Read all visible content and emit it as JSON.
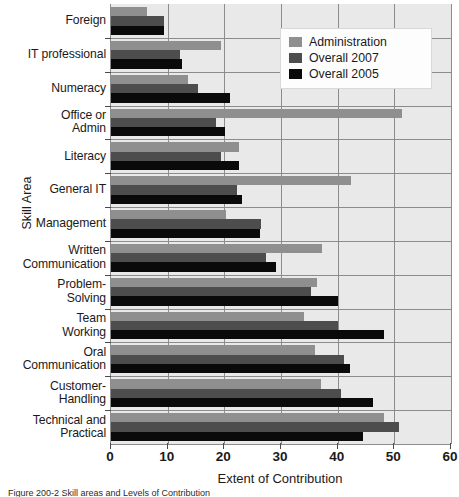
{
  "chart_data": {
    "type": "bar",
    "orientation": "horizontal",
    "title": "",
    "xlabel": "Extent of Contribution",
    "ylabel": "Skill Area",
    "xlim": [
      0,
      60
    ],
    "xticks": [
      0,
      10,
      20,
      30,
      40,
      50,
      60
    ],
    "grid": true,
    "legend_position": "top-right",
    "categories": [
      "Foreign",
      "IT professional",
      "Numeracy",
      "Office or\nAdmin",
      "Literacy",
      "General IT",
      "Management",
      "Written\nCommunication",
      "Problem-\nSolving",
      "Team\nWorking",
      "Oral\nCommunication",
      "Customer-\nHandling",
      "Technical and\nPractical"
    ],
    "series": [
      {
        "name": "Administration",
        "color": "#8f8f8f",
        "values": [
          6.3,
          19.4,
          13.6,
          51.3,
          22.6,
          42.3,
          20.3,
          37.3,
          36.3,
          34.0,
          36.0,
          37.0,
          48.1
        ]
      },
      {
        "name": "Overall 2007",
        "color": "#4d4d4d",
        "values": [
          9.3,
          12.2,
          15.3,
          18.5,
          19.4,
          22.3,
          26.5,
          27.3,
          35.3,
          40.0,
          41.2,
          40.6,
          50.9
        ]
      },
      {
        "name": "Overall 2005",
        "color": "#0a0a0a",
        "values": [
          9.4,
          12.5,
          21.0,
          20.1,
          22.6,
          23.2,
          26.3,
          29.1,
          40.0,
          48.2,
          42.2,
          46.2,
          44.4
        ]
      }
    ]
  },
  "legend": {
    "items": [
      {
        "label": "Administration"
      },
      {
        "label": "Overall 2007"
      },
      {
        "label": "Overall 2005"
      }
    ]
  },
  "caption": "Figure 200-2  Skill areas and Levels of Contribution"
}
